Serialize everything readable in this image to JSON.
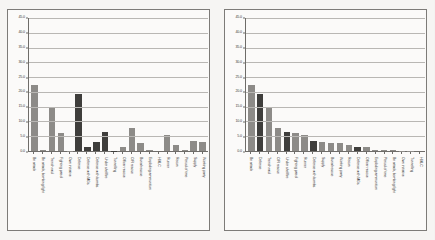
{
  "page": {
    "background": "#f4f3f1",
    "panel_border_color": "#7d7b78"
  },
  "chart_data": [
    {
      "id": "left",
      "type": "bar",
      "title": "",
      "xlabel": "",
      "ylabel": "",
      "ylim": [
        0.0,
        45.0
      ],
      "ytick_step": 5.0,
      "grid": true,
      "legend": "none",
      "sorted": false,
      "ytick_labels": [
        "0.0",
        "5.0",
        "10.0",
        "15.0",
        "20.0",
        "25.0",
        "30.0",
        "35.0",
        "40.0",
        "45.0"
      ],
      "categories": [
        "Bn attack",
        "Bn attack, bombing fight",
        "Trench raid",
        "Fighting patrol",
        "Own initiative",
        "Defence",
        "Defence with MGs",
        "Defence with bombs",
        "Under shellfire",
        "Tunnelling",
        "Officer rescue",
        "O/R rescue",
        "Burial rescue",
        "Exploding ammunition",
        "HMLC",
        "Runner",
        "Recon",
        "Period of time",
        "Supply",
        "Working party"
      ],
      "values": [
        22.3,
        0.4,
        14.7,
        6.0,
        0.1,
        19.4,
        1.5,
        3.2,
        6.5,
        0.1,
        1.4,
        7.9,
        2.8,
        0.4,
        0.0,
        5.4,
        1.9,
        0.5,
        3.3,
        2.9
      ],
      "shades": [
        "mid",
        "mid",
        "mid",
        "mid",
        "mid",
        "dark",
        "dark",
        "dark",
        "dark",
        "dark",
        "mid",
        "mid",
        "mid",
        "mid",
        "mid",
        "mid",
        "mid",
        "mid",
        "mid",
        "mid"
      ]
    },
    {
      "id": "right",
      "type": "bar",
      "title": "",
      "xlabel": "",
      "ylabel": "",
      "ylim": [
        0.0,
        45.0
      ],
      "ytick_step": 5.0,
      "grid": true,
      "legend": "none",
      "sorted": true,
      "ytick_labels": [
        "0.0",
        "5.0",
        "10.0",
        "15.0",
        "20.0",
        "25.0",
        "30.0",
        "35.0",
        "40.0",
        "45.0"
      ],
      "categories": [
        "Bn attack",
        "Defence",
        "Trench raid",
        "O/R rescue",
        "Under shellfire",
        "Fighting patrol",
        "Runner",
        "Defence with bombs",
        "Supply",
        "Burial rescue",
        "Working party",
        "Recon",
        "Defence with MGs",
        "Officer rescue",
        "Exploding ammunition",
        "Period of time",
        "Bn attack, bombing fight",
        "Own initiative",
        "Tunnelling",
        "HMLC"
      ],
      "values": [
        22.3,
        19.4,
        14.7,
        7.9,
        6.5,
        6.0,
        5.4,
        3.3,
        2.9,
        2.8,
        2.8,
        1.9,
        1.5,
        1.4,
        0.5,
        0.5,
        0.4,
        0.1,
        0.1,
        0.0
      ],
      "shades": [
        "mid",
        "dark",
        "mid",
        "mid",
        "dark",
        "mid",
        "mid",
        "dark",
        "mid",
        "mid",
        "mid",
        "mid",
        "dark",
        "mid",
        "mid",
        "mid",
        "mid",
        "mid",
        "mid",
        "mid"
      ]
    }
  ]
}
